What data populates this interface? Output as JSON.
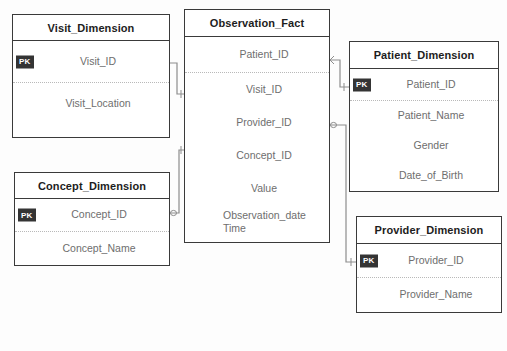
{
  "diagram": {
    "background_color": "#fdfdfd",
    "border_color": "#3a3a3a",
    "field_text_color": "#6e6e6e",
    "header_text_color": "#1d1d1d",
    "connector_color": "#8d8d8d",
    "pk_badge_color": "#343434",
    "pk_badge_text_color": "#ffffff",
    "pk_label": "PK"
  },
  "entities": {
    "visit": {
      "name": "Visit_Dimension",
      "fields": [
        {
          "label": "Visit_ID",
          "pk": true,
          "separator": true
        },
        {
          "label": "Visit_Location",
          "pk": false,
          "separator": false
        }
      ]
    },
    "concept": {
      "name": "Concept_Dimension",
      "fields": [
        {
          "label": "Concept_ID",
          "pk": true,
          "separator": true
        },
        {
          "label": "Concept_Name",
          "pk": false,
          "separator": false
        }
      ]
    },
    "observation": {
      "name": "Observation_Fact",
      "fields": [
        {
          "label": "Patient_ID",
          "pk": false,
          "separator": true
        },
        {
          "label": "Visit_ID",
          "pk": false,
          "separator": false
        },
        {
          "label": "Provider_ID",
          "pk": false,
          "separator": false
        },
        {
          "label": "Concept_ID",
          "pk": false,
          "separator": false
        },
        {
          "label": "Value",
          "pk": false,
          "separator": false
        },
        {
          "label": "Observation_date\nTime",
          "pk": false,
          "separator": false
        }
      ]
    },
    "patient": {
      "name": "Patient_Dimension",
      "fields": [
        {
          "label": "Patient_ID",
          "pk": true,
          "separator": true
        },
        {
          "label": "Patient_Name",
          "pk": false,
          "separator": false
        },
        {
          "label": "Gender",
          "pk": false,
          "separator": false
        },
        {
          "label": "Date_of_Birth",
          "pk": false,
          "separator": false
        }
      ]
    },
    "provider": {
      "name": "Provider_Dimension",
      "fields": [
        {
          "label": "Provider_ID",
          "pk": true,
          "separator": true
        },
        {
          "label": "Provider_Name",
          "pk": false,
          "separator": false
        }
      ]
    }
  },
  "relationships": [
    {
      "name": "visit-to-observation",
      "from_entity": "visit",
      "from_field": "Visit_ID",
      "to_entity": "observation",
      "to_field": "Visit_ID",
      "from_marker": "crows-foot",
      "to_marker": "one"
    },
    {
      "name": "concept-to-observation",
      "from_entity": "concept",
      "from_field": "Concept_ID",
      "to_entity": "observation",
      "to_field": "Concept_ID",
      "from_marker": "crows-foot",
      "to_marker": "one"
    },
    {
      "name": "observation-to-patient",
      "from_entity": "observation",
      "from_field": "Patient_ID",
      "to_entity": "patient",
      "to_field": "Patient_ID",
      "from_marker": "crows-foot",
      "to_marker": "one"
    },
    {
      "name": "observation-to-provider",
      "from_entity": "observation",
      "from_field": "Provider_ID",
      "to_entity": "provider",
      "to_field": "Provider_ID",
      "from_marker": "crows-foot",
      "to_marker": "one"
    }
  ]
}
